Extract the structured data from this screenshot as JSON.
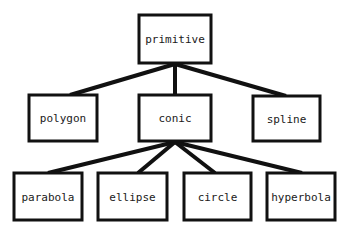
{
  "diagram": {
    "type": "tree",
    "colors": {
      "stroke": "#111111",
      "text": "#1a1a1a",
      "background": "#ffffff"
    },
    "nodes": [
      {
        "id": "primitive",
        "label": "primitive",
        "x": 139,
        "y": 15,
        "w": 72,
        "h": 48
      },
      {
        "id": "polygon",
        "label": "polygon",
        "x": 29,
        "y": 95,
        "w": 68,
        "h": 46
      },
      {
        "id": "conic",
        "label": "conic",
        "x": 139,
        "y": 95,
        "w": 72,
        "h": 46
      },
      {
        "id": "spline",
        "label": "spline",
        "x": 253,
        "y": 96,
        "w": 67,
        "h": 45
      },
      {
        "id": "parabola",
        "label": "parabola",
        "x": 14,
        "y": 173,
        "w": 68,
        "h": 47
      },
      {
        "id": "ellipse",
        "label": "ellipse",
        "x": 98,
        "y": 173,
        "w": 69,
        "h": 47
      },
      {
        "id": "circle",
        "label": "circle",
        "x": 184,
        "y": 173,
        "w": 67,
        "h": 47
      },
      {
        "id": "hyperbola",
        "label": "hyperbola",
        "x": 267,
        "y": 173,
        "w": 68,
        "h": 47
      }
    ],
    "edges": [
      {
        "from": "primitive",
        "to": "polygon",
        "x1": 175,
        "y1": 64,
        "x2": 70,
        "y2": 95
      },
      {
        "from": "primitive",
        "to": "conic",
        "x1": 175,
        "y1": 64,
        "x2": 175,
        "y2": 95
      },
      {
        "from": "primitive",
        "to": "spline",
        "x1": 175,
        "y1": 64,
        "x2": 286,
        "y2": 96
      },
      {
        "from": "conic",
        "to": "parabola",
        "x1": 175,
        "y1": 142,
        "x2": 48,
        "y2": 173
      },
      {
        "from": "conic",
        "to": "ellipse",
        "x1": 175,
        "y1": 142,
        "x2": 138,
        "y2": 173
      },
      {
        "from": "conic",
        "to": "circle",
        "x1": 175,
        "y1": 142,
        "x2": 215,
        "y2": 173
      },
      {
        "from": "conic",
        "to": "hyperbola",
        "x1": 175,
        "y1": 142,
        "x2": 302,
        "y2": 173
      }
    ]
  }
}
